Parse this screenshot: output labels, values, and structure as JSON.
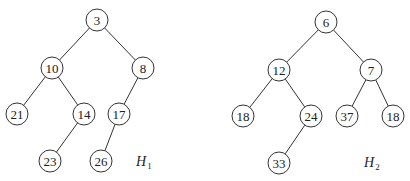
{
  "diagram": {
    "type": "binary-heaps",
    "radius": 11,
    "stroke_color": "#333333",
    "heaps": [
      {
        "name": "H",
        "subscript": "1",
        "label_pos": [
          136,
          166
        ],
        "nodes": [
          {
            "id": "h1n0",
            "value": "3",
            "x": 97,
            "y": 20
          },
          {
            "id": "h1n1",
            "value": "10",
            "x": 52,
            "y": 68
          },
          {
            "id": "h1n2",
            "value": "8",
            "x": 143,
            "y": 68
          },
          {
            "id": "h1n3",
            "value": "21",
            "x": 17,
            "y": 114
          },
          {
            "id": "h1n4",
            "value": "14",
            "x": 84,
            "y": 114
          },
          {
            "id": "h1n5",
            "value": "17",
            "x": 119,
            "y": 114
          },
          {
            "id": "h1n6",
            "value": "23",
            "x": 50,
            "y": 161
          },
          {
            "id": "h1n7",
            "value": "26",
            "x": 101,
            "y": 161
          }
        ],
        "edges": [
          [
            "h1n0",
            "h1n1"
          ],
          [
            "h1n0",
            "h1n2"
          ],
          [
            "h1n1",
            "h1n3"
          ],
          [
            "h1n1",
            "h1n4"
          ],
          [
            "h1n2",
            "h1n5"
          ],
          [
            "h1n4",
            "h1n6"
          ],
          [
            "h1n5",
            "h1n7"
          ]
        ]
      },
      {
        "name": "H",
        "subscript": "2",
        "label_pos": [
          364,
          167
        ],
        "nodes": [
          {
            "id": "h2n0",
            "value": "6",
            "x": 326,
            "y": 22
          },
          {
            "id": "h2n1",
            "value": "12",
            "x": 279,
            "y": 70
          },
          {
            "id": "h2n2",
            "value": "7",
            "x": 371,
            "y": 70
          },
          {
            "id": "h2n3",
            "value": "18",
            "x": 243,
            "y": 116
          },
          {
            "id": "h2n4",
            "value": "24",
            "x": 311,
            "y": 116
          },
          {
            "id": "h2n5",
            "value": "37",
            "x": 347,
            "y": 116
          },
          {
            "id": "h2n6",
            "value": "18",
            "x": 393,
            "y": 116
          },
          {
            "id": "h2n7",
            "value": "33",
            "x": 279,
            "y": 163
          }
        ],
        "edges": [
          [
            "h2n0",
            "h2n1"
          ],
          [
            "h2n0",
            "h2n2"
          ],
          [
            "h2n1",
            "h2n3"
          ],
          [
            "h2n1",
            "h2n4"
          ],
          [
            "h2n2",
            "h2n5"
          ],
          [
            "h2n2",
            "h2n6"
          ],
          [
            "h2n4",
            "h2n7"
          ]
        ]
      }
    ]
  }
}
